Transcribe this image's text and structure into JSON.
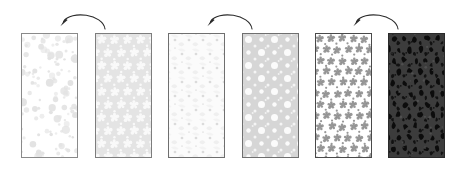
{
  "figure": {
    "width": 463,
    "height": 174,
    "background": "#ffffff",
    "panel_count": 6,
    "arrow_count": 3
  },
  "panels": [
    {
      "id": "panel-1",
      "label": "dilute random dispersion",
      "x": 21,
      "y": 33,
      "width": 57,
      "height": 125,
      "background": "#ffffff",
      "border_color": "#8a8a8a",
      "border_width": 1,
      "feature_color": "#e2e2e2",
      "feature_shape": "circle",
      "arrangement": "random",
      "density": "low",
      "size_range": [
        1.2,
        4.2
      ]
    },
    {
      "id": "panel-2",
      "label": "periodic white clusters on light matrix",
      "x": 95,
      "y": 33,
      "width": 57,
      "height": 125,
      "background": "#e4e4e4",
      "border_color": "#7d7d7d",
      "border_width": 1,
      "feature_color": "#fafafa",
      "feature_shape": "cluster",
      "arrangement": "periodic-lattice",
      "density": "high",
      "cell": 13
    },
    {
      "id": "panel-3",
      "label": "faint dot and squiggle texture",
      "x": 168,
      "y": 33,
      "width": 57,
      "height": 125,
      "background": "#fbfbfb",
      "border_color": "#6f6f6f",
      "border_width": 1,
      "feature_color": "#ececec",
      "feature_shape": "dot-and-arc",
      "arrangement": "periodic-lattice",
      "density": "low",
      "cell": 14
    },
    {
      "id": "panel-4",
      "label": "periodic white circles on gray matrix",
      "x": 242,
      "y": 33,
      "width": 57,
      "height": 125,
      "background": "#d6d6d6",
      "border_color": "#6f6f6f",
      "border_width": 1,
      "feature_color": "#fdfdfd",
      "feature_shape": "circle",
      "arrangement": "periodic-grid",
      "density": "high",
      "cell": 13
    },
    {
      "id": "panel-5",
      "label": "dense gray clusters on white matrix",
      "x": 315,
      "y": 33,
      "width": 57,
      "height": 125,
      "background": "#ffffff",
      "border_color": "#4a4a4a",
      "border_width": 1,
      "feature_color": "#8d8d8d",
      "feature_shape": "cluster",
      "arrangement": "diagonal-lattice",
      "density": "very-high",
      "cell": 11
    },
    {
      "id": "panel-6",
      "label": "black inclusions on dark matrix",
      "x": 388,
      "y": 33,
      "width": 57,
      "height": 125,
      "background": "#3c3c3c",
      "border_color": "#2a2a2a",
      "border_width": 1,
      "feature_color": "#0a0a0a",
      "feature_shape": "irregular",
      "arrangement": "periodic-lattice",
      "density": "very-high",
      "cell": 11
    }
  ],
  "arrows": [
    {
      "id": "arrow-1",
      "direction": "leftward-arc",
      "from_panel": "panel-2",
      "to_panel": "panel-1",
      "x": 57,
      "y": 8,
      "width": 52,
      "height": 24,
      "color": "#2b2b2b"
    },
    {
      "id": "arrow-2",
      "direction": "leftward-arc",
      "from_panel": "panel-4",
      "to_panel": "panel-3",
      "x": 204,
      "y": 8,
      "width": 52,
      "height": 24,
      "color": "#2b2b2b"
    },
    {
      "id": "arrow-3",
      "direction": "leftward-arc",
      "from_panel": "panel-6",
      "to_panel": "panel-5",
      "x": 350,
      "y": 8,
      "width": 52,
      "height": 24,
      "color": "#2b2b2b"
    }
  ]
}
